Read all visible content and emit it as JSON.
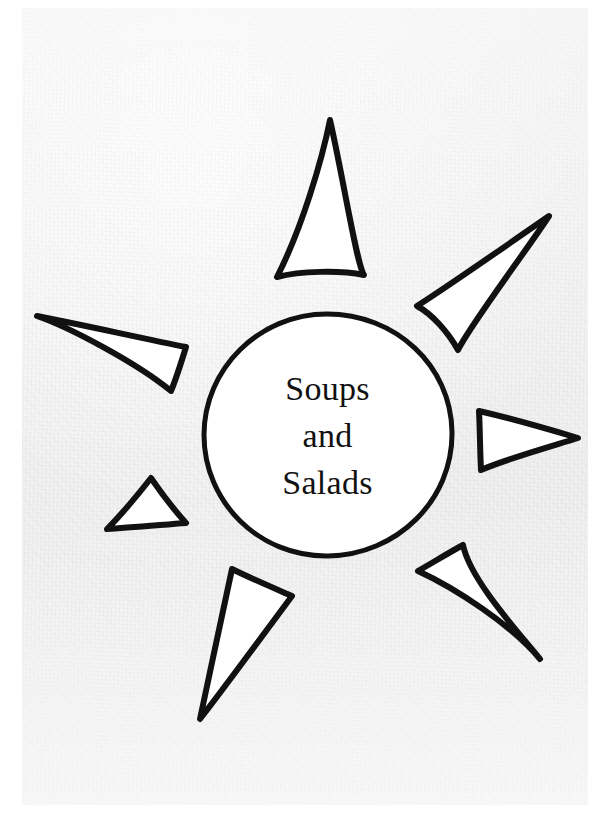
{
  "page": {
    "width": 614,
    "height": 828,
    "background_color": "#ffffff",
    "paper_color": "#f0f0f0",
    "ink_color": "#111111",
    "title": "Soups and Salads"
  },
  "illustration": {
    "name": "hand-drawn-sun",
    "description": "Hand drawn sun with a central circle and eight triangular rays",
    "disc": {
      "center_x": 327,
      "center_y": 435,
      "radius": 122,
      "stroke_width": 5,
      "fill": "#ffffff",
      "stroke": "#111111"
    },
    "rays": [
      {
        "name": "ray-top",
        "stroke_width": 6,
        "points": "330,120 276,278 365,272 345,282 282,283"
      },
      {
        "name": "ray-upper-right",
        "stroke_width": 6,
        "points": "549,217 418,306 459,349 455,322"
      },
      {
        "name": "ray-right",
        "stroke_width": 6,
        "points": "577,437 478,411 481,469"
      },
      {
        "name": "ray-lower-right",
        "stroke_width": 6,
        "points": "539,658 418,572 463,548 470,580"
      },
      {
        "name": "ray-bottom",
        "stroke_width": 6,
        "points": "200,719 232,569 291,595 252,583"
      },
      {
        "name": "ray-lower-left",
        "stroke_width": 6,
        "points": "107,528 150,478 185,522"
      },
      {
        "name": "ray-left",
        "stroke_width": 6,
        "points": "37,316 185,345 171,391 160,352"
      },
      {
        "name": "ray-upper-left-small",
        "stroke_width": 6,
        "points": "37,316 184,347 128,332"
      }
    ]
  },
  "center_label": {
    "lines": [
      "Soups",
      "and",
      "Salads"
    ],
    "font_size_px": 34
  }
}
